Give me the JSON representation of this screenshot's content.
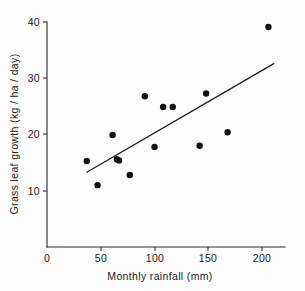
{
  "chart_data": {
    "type": "scatter",
    "title": "",
    "xlabel": "Monthly rainfall (mm)",
    "ylabel": "Grass leaf growth (kg / ha / day)",
    "xlim": [
      0,
      215
    ],
    "ylim": [
      0,
      41.5
    ],
    "grid": false,
    "legend": null,
    "xticks": [
      0,
      50,
      100,
      150,
      200
    ],
    "xticklabels": [
      "0",
      "50",
      "100",
      "150",
      "200"
    ],
    "yticks": [
      0,
      10,
      20,
      30,
      40
    ],
    "yticklabels": [
      "0",
      "10",
      "20",
      "30",
      "40"
    ],
    "x": [
      37,
      47,
      61,
      65,
      67,
      77,
      91,
      100,
      108,
      117,
      142,
      148,
      168,
      206
    ],
    "y": [
      15.3,
      11.0,
      19.9,
      15.6,
      15.4,
      12.8,
      26.8,
      17.8,
      24.9,
      24.9,
      18.0,
      27.3,
      20.4,
      39.1
    ],
    "points": [
      {
        "x": 37,
        "y": 15.3
      },
      {
        "x": 47,
        "y": 11.0
      },
      {
        "x": 61,
        "y": 19.9
      },
      {
        "x": 65,
        "y": 15.6
      },
      {
        "x": 67,
        "y": 15.4
      },
      {
        "x": 77,
        "y": 12.8
      },
      {
        "x": 91,
        "y": 26.8
      },
      {
        "x": 100,
        "y": 17.8
      },
      {
        "x": 108,
        "y": 24.9
      },
      {
        "x": 117,
        "y": 24.9
      },
      {
        "x": 142,
        "y": 18.0
      },
      {
        "x": 148,
        "y": 27.3
      },
      {
        "x": 168,
        "y": 20.4
      },
      {
        "x": 206,
        "y": 39.1
      }
    ],
    "marker": {
      "shape": "circle",
      "size": 3.2,
      "color": "#111111"
    },
    "trendline": {
      "type": "linear-fit",
      "x_start": 37,
      "y_start": 13.3,
      "x_end": 211,
      "y_end": 32.6,
      "color": "#1a1a1a"
    },
    "axes_style": "left-and-bottom-spines",
    "tick_direction": "out"
  }
}
